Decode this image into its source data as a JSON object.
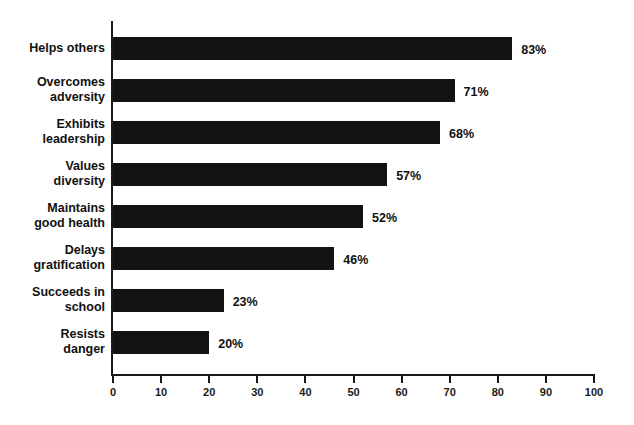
{
  "chart_data": {
    "type": "bar",
    "orientation": "horizontal",
    "title": "",
    "xlabel": "",
    "ylabel": "",
    "xlim": [
      0,
      100
    ],
    "xticks": [
      0,
      10,
      20,
      30,
      40,
      50,
      60,
      70,
      80,
      90,
      100
    ],
    "xtick_labels": [
      "0",
      "10",
      "20",
      "30",
      "40",
      "50",
      "60",
      "70",
      "80",
      "90",
      "100"
    ],
    "grid": false,
    "legend": null,
    "value_label_suffix": "%",
    "bar_color": "#131313",
    "axis_color": "#1a1a1a",
    "background_color": "#ffffff",
    "categories": [
      "Helps others",
      "Overcomes adversity",
      "Exhibits leadership",
      "Values diversity",
      "Maintains good health",
      "Delays gratification",
      "Succeeds in school",
      "Resists danger"
    ],
    "values": [
      83,
      71,
      68,
      57,
      52,
      46,
      23,
      20
    ],
    "bars": [
      {
        "label_lines": [
          "Helps others"
        ],
        "value": 83,
        "value_label": "83%"
      },
      {
        "label_lines": [
          "Overcomes",
          "adversity"
        ],
        "value": 71,
        "value_label": "71%"
      },
      {
        "label_lines": [
          "Exhibits",
          "leadership"
        ],
        "value": 68,
        "value_label": "68%"
      },
      {
        "label_lines": [
          "Values",
          "diversity"
        ],
        "value": 57,
        "value_label": "57%"
      },
      {
        "label_lines": [
          "Maintains",
          "good health"
        ],
        "value": 52,
        "value_label": "52%"
      },
      {
        "label_lines": [
          "Delays",
          "gratification"
        ],
        "value": 46,
        "value_label": "46%"
      },
      {
        "label_lines": [
          "Succeeds in",
          "school"
        ],
        "value": 23,
        "value_label": "23%"
      },
      {
        "label_lines": [
          "Resists",
          "danger"
        ],
        "value": 20,
        "value_label": "20%"
      }
    ]
  }
}
